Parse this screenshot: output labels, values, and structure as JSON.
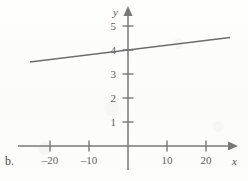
{
  "figure": {
    "part_label": "b.",
    "colors": {
      "axis": "#78787a",
      "line": "#6e6e70",
      "label_text": "#5f5f61",
      "background": "#fdfdfc"
    }
  },
  "chart_data": {
    "type": "line",
    "title": "",
    "xlabel": "x",
    "ylabel": "y",
    "xlim": [
      -27,
      27
    ],
    "ylim": [
      -0.35,
      5.6
    ],
    "grid": false,
    "legend": null,
    "xticks": [
      -20,
      -10,
      10,
      20
    ],
    "xtick_labels": [
      "–20",
      "–10",
      "10",
      "20"
    ],
    "yticks": [
      1,
      2,
      3,
      4,
      5
    ],
    "ytick_labels": [
      "1",
      "2",
      "3",
      "4",
      "5"
    ],
    "axis_arrows": {
      "x_right": true,
      "x_left": false,
      "y_top": true,
      "y_bottom": false
    },
    "series": [
      {
        "name": "line",
        "slope": 0.02,
        "intercept": 4,
        "x": [
          -25,
          26
        ],
        "values": [
          3.5,
          4.52
        ]
      }
    ]
  }
}
